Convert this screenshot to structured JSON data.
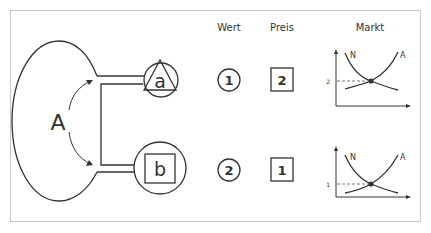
{
  "diagram": {
    "actor_label": "A",
    "good_a_label": "a",
    "good_b_label": "b",
    "columns": {
      "wert": "Wert",
      "preis": "Preis",
      "markt": "Markt"
    },
    "rows": [
      {
        "good": "a",
        "wert": "1",
        "preis": "2",
        "markt": {
          "demand_label": "N",
          "supply_label": "A",
          "equilibrium_price": "2"
        }
      },
      {
        "good": "b",
        "wert": "2",
        "preis": "1",
        "markt": {
          "demand_label": "N",
          "supply_label": "A",
          "equilibrium_price": "1"
        }
      }
    ],
    "colors": {
      "stroke": "#333333",
      "frame": "#c8c8c8",
      "background": "#ffffff"
    }
  }
}
